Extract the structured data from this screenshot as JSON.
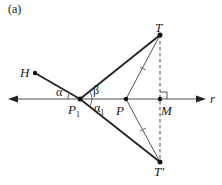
{
  "figure": {
    "panel_label": "(a)",
    "points": {
      "H": "H",
      "T": "T",
      "T_prime": "T′",
      "P": "P",
      "P1": "P",
      "P1_sub": "1",
      "M": "M"
    },
    "line_label": "r",
    "angles": {
      "alpha": "α",
      "beta": "β",
      "alpha1": "α",
      "alpha1_sub": "1"
    },
    "colors": {
      "axis": "#888888",
      "thick_line": "#222222",
      "thin_line": "#555555",
      "dashed": "#444444"
    }
  }
}
